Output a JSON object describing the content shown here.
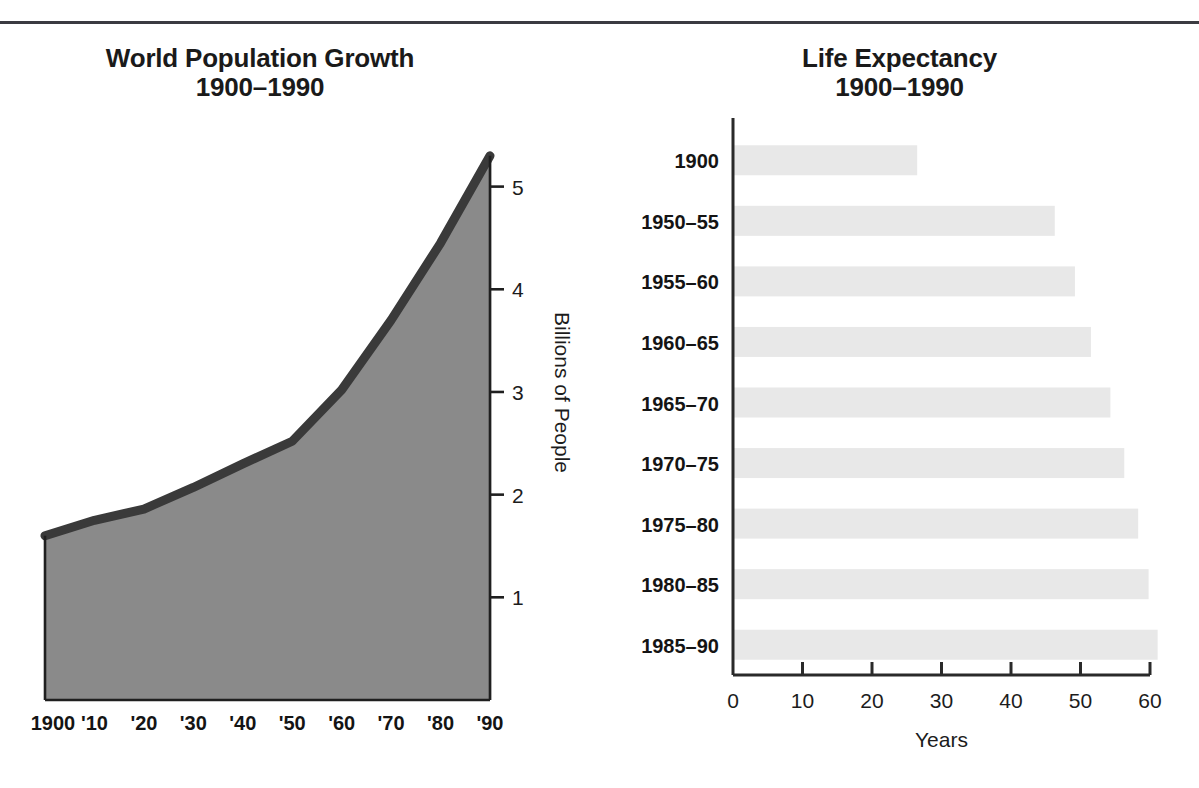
{
  "page": {
    "background_color": "#ffffff",
    "rule_color": "#3b3b41"
  },
  "left_panel": {
    "title_line1": "World Population Growth",
    "title_line2": "1900–1990",
    "y_axis_title": "Billions of People"
  },
  "right_panel": {
    "title_line1": "Life Expectancy",
    "title_line2": "1900–1990",
    "x_axis_title": "Years"
  },
  "chart_data": [
    {
      "type": "area",
      "title": "World Population Growth 1900–1990",
      "xlabel": "",
      "ylabel": "Billions of People",
      "categories": [
        "1900",
        "'10",
        "'20",
        "'30",
        "'40",
        "'50",
        "'60",
        "'70",
        "'80",
        "'90"
      ],
      "x": [
        1900,
        1910,
        1920,
        1930,
        1940,
        1950,
        1960,
        1970,
        1980,
        1990
      ],
      "values": [
        1.6,
        1.75,
        1.86,
        2.07,
        2.3,
        2.52,
        3.02,
        3.7,
        4.45,
        5.3
      ],
      "xlim": [
        1900,
        1990
      ],
      "ylim": [
        0,
        5.6
      ],
      "yticks": [
        1,
        2,
        3,
        4,
        5
      ],
      "ytick_labels": [
        "1",
        "2",
        "3",
        "4",
        "5"
      ],
      "grid": true,
      "fill_color": "#8a8a8a",
      "line_color": "#3a3a3a",
      "legend": "none"
    },
    {
      "type": "bar",
      "orientation": "horizontal",
      "title": "Life Expectancy 1900–1990",
      "xlabel": "Years",
      "ylabel": "",
      "categories": [
        "1900",
        "1950–55",
        "1955–60",
        "1960–65",
        "1965–70",
        "1970–75",
        "1975–80",
        "1980–85",
        "1985–90"
      ],
      "values": [
        26.5,
        46.3,
        49.2,
        51.5,
        54.3,
        56.3,
        58.3,
        59.8,
        61.1
      ],
      "xlim": [
        0,
        60
      ],
      "xticks": [
        0,
        10,
        20,
        30,
        40,
        50,
        60
      ],
      "xtick_labels": [
        "0",
        "10",
        "20",
        "30",
        "40",
        "50",
        "60"
      ],
      "grid": false,
      "bar_color": "#e8e8e8",
      "axis_color": "#2a2a2a",
      "legend": "none"
    }
  ]
}
